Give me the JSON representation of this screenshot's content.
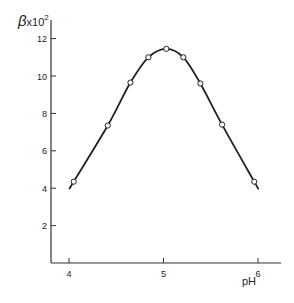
{
  "chart_data": {
    "type": "line",
    "title": "",
    "xlabel": "pH",
    "ylabel": "β×10²",
    "xlim": [
      3.8,
      6.25
    ],
    "ylim": [
      0,
      13
    ],
    "x_ticks": [
      4,
      5,
      6
    ],
    "y_ticks": [
      2,
      4,
      6,
      8,
      10,
      12
    ],
    "grid": false,
    "legend": null,
    "series": [
      {
        "name": "β×10² vs pH",
        "marker": "open-circle",
        "smooth": true,
        "x": [
          4.05,
          4.41,
          4.65,
          4.84,
          5.03,
          5.21,
          5.39,
          5.62,
          5.96
        ],
        "y": [
          4.35,
          7.35,
          9.65,
          11.0,
          11.45,
          11.0,
          9.6,
          7.4,
          4.35
        ]
      }
    ]
  },
  "labels": {
    "y_axis": "β",
    "y_axis_suffix": "x10",
    "y_axis_exp": "2",
    "x_axis": "pH"
  }
}
